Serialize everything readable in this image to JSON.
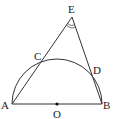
{
  "diagram": {
    "type": "geometry",
    "points": {
      "A": {
        "label": "A",
        "x": 12,
        "y": 104
      },
      "B": {
        "label": "B",
        "x": 102,
        "y": 104
      },
      "O": {
        "label": "O",
        "x": 57,
        "y": 104
      },
      "C": {
        "label": "C",
        "x": 43,
        "y": 58
      },
      "D": {
        "label": "D",
        "x": 92,
        "y": 77
      },
      "E": {
        "label": "E",
        "x": 72,
        "y": 17
      }
    },
    "segments": [
      "AB",
      "AE",
      "BE"
    ],
    "arc": {
      "center": "O",
      "radius": 45,
      "from": "A",
      "to": "B",
      "type": "semicircle"
    },
    "angle_mark": {
      "vertex": "E",
      "style": "double-arc"
    },
    "colors": {
      "stroke": "#333333",
      "background": "#ffffff"
    }
  }
}
